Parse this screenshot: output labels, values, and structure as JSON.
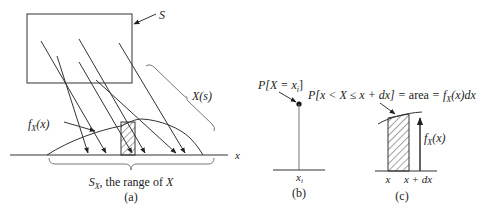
{
  "panels": {
    "a": {
      "caption": "(a)",
      "sample_space_label": "S",
      "mapping_label": "X(s)",
      "pdf_label": "f",
      "pdf_sub": "X",
      "pdf_arg": "(x)",
      "axis_label": "x",
      "range_label_pre": "S",
      "range_label_sub": "X",
      "range_label_post": ", the range of ",
      "range_label_var": "X"
    },
    "b": {
      "caption": "(b)",
      "prob_label_pre": "P[X = x",
      "prob_label_sub": "i",
      "prob_label_post": "]",
      "point_label": "x",
      "point_sub": "i"
    },
    "c": {
      "caption": "(c)",
      "equation_a": "P[x < X ≤ x + dx] = ",
      "equation_b": "area",
      "equation_c": " = f",
      "equation_sub": "X",
      "equation_d": "(x)dx",
      "height_label": "f",
      "height_sub": "X",
      "height_arg": "(x)",
      "left_tick": "x",
      "right_tick": "x + dx"
    }
  }
}
